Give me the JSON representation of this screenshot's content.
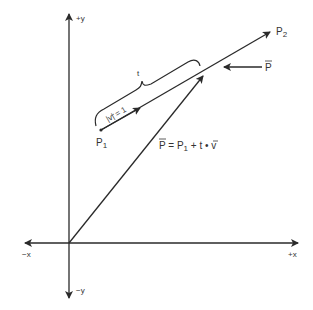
{
  "diagram": {
    "axes": {
      "pos_y": "+y",
      "neg_y": "−y",
      "pos_x": "+x",
      "neg_x": "−x"
    },
    "points": {
      "p1": "P",
      "p1_sub": "1",
      "p2": "P",
      "p2_sub": "2"
    },
    "point_p_label": "P",
    "unit_vector_label": "|v| = 1",
    "t_label": "t",
    "equation": {
      "lhs": "P",
      "eq": " = P",
      "sub": "1",
      "rest": " + t • v"
    },
    "colors": {
      "stroke": "#2a2a2a",
      "text": "#333333",
      "background": "#ffffff"
    }
  }
}
